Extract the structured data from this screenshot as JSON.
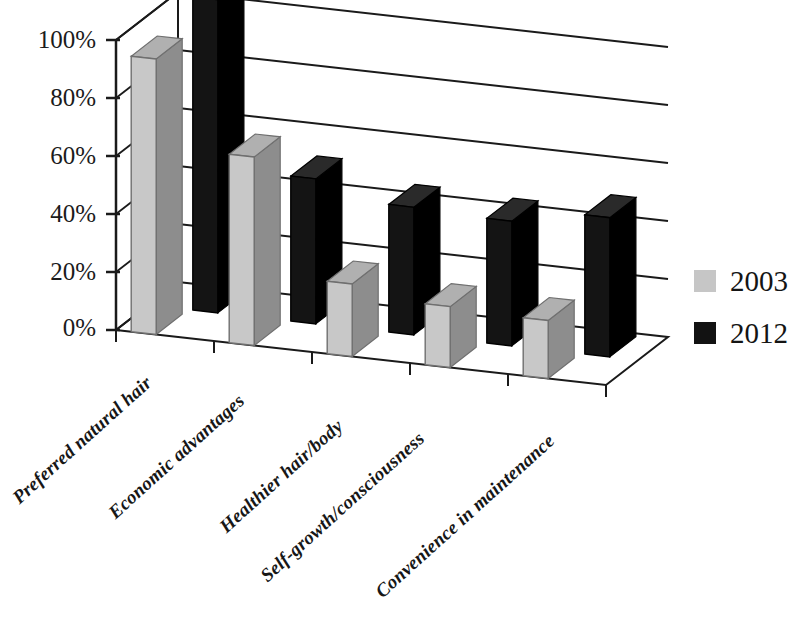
{
  "chart_data": {
    "type": "bar",
    "title": "",
    "subtitle": "",
    "xlabel": "",
    "ylabel": "",
    "ylim": [
      0,
      110
    ],
    "y_ticks": [
      "0%",
      "20%",
      "40%",
      "60%",
      "80%",
      "100%"
    ],
    "y_tick_values": [
      0,
      20,
      40,
      60,
      80,
      100
    ],
    "grid": true,
    "projection": "3d-clustered-column",
    "legend_position": "right",
    "categories": [
      "Preferred natural hair",
      "Economic advantages",
      "Healthier hair/body",
      "Self-growth/consciousness",
      "Convenience in maintenance"
    ],
    "series": [
      {
        "name": "2003",
        "color": "#c6c6c6",
        "values": [
          95,
          65,
          25,
          21,
          20
        ]
      },
      {
        "name": "2012",
        "color": "#121212",
        "values": [
          108,
          50,
          44,
          43,
          48
        ]
      }
    ]
  },
  "legend": {
    "items": [
      {
        "label": "2003",
        "swatch": "#c6c6c6"
      },
      {
        "label": "2012",
        "swatch": "#121212"
      }
    ]
  },
  "axis": {
    "y_labels": [
      "100%",
      "80%",
      "60%",
      "40%",
      "20%",
      "0%"
    ]
  },
  "colors": {
    "series_2003_front": "#c8c8c8",
    "series_2003_top": "#b0b0b0",
    "series_2003_side": "#8d8d8d",
    "series_2012_front": "#141414",
    "series_2012_top": "#2a2a2a",
    "series_2012_side": "#000000",
    "axis_line": "#1a1a1a",
    "background": "#ffffff"
  }
}
